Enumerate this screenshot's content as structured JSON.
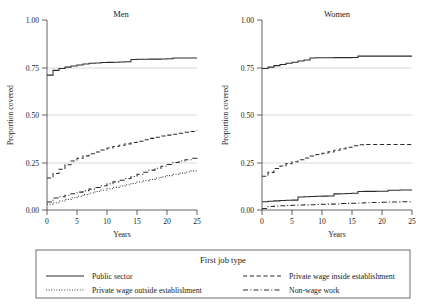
{
  "figure": {
    "background": "#ffffff",
    "line_color": "#2b2b2b",
    "grid_color": "#c8c8c8"
  },
  "panels": [
    {
      "title": "Men"
    },
    {
      "title": "Women"
    }
  ],
  "axes": {
    "xlabel": "Years",
    "ylabel": "Proportion covered",
    "xticks": [
      "0",
      "5",
      "10",
      "15",
      "20",
      "25"
    ],
    "yticks": [
      "0.00",
      "0.25",
      "0.50",
      "0.75",
      "1.00"
    ]
  },
  "legend": {
    "title": "First job type",
    "entries": [
      {
        "label": "Public sector",
        "style": "solid"
      },
      {
        "label": "Private wage inside establishment",
        "style": "dashed"
      },
      {
        "label": "Private wage outside establishment",
        "style": "dotted"
      },
      {
        "label": "Non-wage work",
        "style": "dashdot"
      }
    ]
  },
  "chart_data": {
    "type": "line",
    "title": "",
    "xlabel": "Years",
    "ylabel": "Proportion covered",
    "xlim": [
      0,
      25
    ],
    "ylim": [
      0.0,
      1.0
    ],
    "xticks": [
      0,
      5,
      10,
      15,
      20,
      25
    ],
    "yticks": [
      0.0,
      0.25,
      0.5,
      0.75,
      1.0
    ],
    "grid": "horizontal gridlines at 0.25, 0.50, 0.75",
    "legend_position": "bottom",
    "legend_title": "First job type",
    "panels": [
      {
        "name": "Men",
        "x": [
          0,
          1,
          2,
          3,
          4,
          5,
          6,
          7,
          8,
          9,
          10,
          11,
          12,
          13,
          14,
          15,
          16,
          17,
          18,
          19,
          20,
          21,
          22,
          23,
          24,
          25
        ],
        "series": [
          {
            "name": "Public sector",
            "style": "solid",
            "values": [
              0.71,
              0.735,
              0.745,
              0.752,
              0.758,
              0.763,
              0.768,
              0.772,
              0.774,
              0.776,
              0.777,
              0.778,
              0.779,
              0.78,
              0.792,
              0.793,
              0.793,
              0.794,
              0.794,
              0.795,
              0.796,
              0.8,
              0.8,
              0.8,
              0.8,
              0.8
            ]
          },
          {
            "name": "Private wage inside establishment",
            "style": "dashed",
            "values": [
              0.168,
              0.192,
              0.215,
              0.238,
              0.258,
              0.272,
              0.285,
              0.296,
              0.305,
              0.316,
              0.326,
              0.334,
              0.341,
              0.348,
              0.355,
              0.362,
              0.37,
              0.377,
              0.383,
              0.389,
              0.394,
              0.399,
              0.404,
              0.409,
              0.413,
              0.418
            ]
          },
          {
            "name": "Private wage outside establishment",
            "style": "dotted",
            "values": [
              0.03,
              0.038,
              0.047,
              0.056,
              0.064,
              0.072,
              0.081,
              0.089,
              0.097,
              0.104,
              0.112,
              0.119,
              0.126,
              0.133,
              0.14,
              0.147,
              0.154,
              0.161,
              0.168,
              0.175,
              0.181,
              0.188,
              0.194,
              0.2,
              0.206,
              0.212
            ]
          },
          {
            "name": "Non-wage work",
            "style": "dashdot",
            "values": [
              0.042,
              0.063,
              0.07,
              0.078,
              0.086,
              0.094,
              0.102,
              0.11,
              0.118,
              0.128,
              0.138,
              0.148,
              0.157,
              0.166,
              0.176,
              0.188,
              0.199,
              0.21,
              0.22,
              0.23,
              0.24,
              0.25,
              0.258,
              0.264,
              0.272,
              0.282
            ]
          }
        ]
      },
      {
        "name": "Women",
        "x": [
          0,
          1,
          2,
          3,
          4,
          5,
          6,
          7,
          8,
          9,
          10,
          11,
          12,
          13,
          14,
          15,
          16,
          17,
          18,
          19,
          20,
          21,
          22,
          23,
          24,
          25
        ],
        "series": [
          {
            "name": "Public sector",
            "style": "solid",
            "values": [
              0.745,
              0.752,
              0.76,
              0.766,
              0.772,
              0.778,
              0.784,
              0.79,
              0.8,
              0.801,
              0.801,
              0.801,
              0.802,
              0.802,
              0.802,
              0.803,
              0.81,
              0.81,
              0.81,
              0.81,
              0.81,
              0.81,
              0.81,
              0.81,
              0.81,
              0.81
            ]
          },
          {
            "name": "Private wage inside establishment",
            "style": "dashed",
            "values": [
              0.178,
              0.198,
              0.218,
              0.232,
              0.244,
              0.254,
              0.264,
              0.274,
              0.284,
              0.292,
              0.299,
              0.306,
              0.314,
              0.322,
              0.33,
              0.338,
              0.343,
              0.345,
              0.345,
              0.345,
              0.345,
              0.345,
              0.345,
              0.345,
              0.345,
              0.345
            ]
          },
          {
            "name": "Private wage outside establishment",
            "style": "dotted",
            "values": [
              0.0,
              0.0,
              0.0,
              0.0,
              0.0,
              0.0,
              0.0,
              0.0,
              0.0,
              0.0,
              0.0,
              0.0,
              0.0,
              0.0,
              0.0,
              0.0,
              0.0,
              0.0,
              0.0,
              0.0,
              0.0,
              0.0,
              0.0,
              0.0,
              0.0,
              0.0
            ]
          },
          {
            "name": "Non-wage work",
            "style": "dashdot",
            "values": [
              0.008,
              0.018,
              0.021,
              0.022,
              0.024,
              0.025,
              0.026,
              0.027,
              0.028,
              0.029,
              0.03,
              0.031,
              0.032,
              0.034,
              0.035,
              0.036,
              0.037,
              0.038,
              0.039,
              0.04,
              0.041,
              0.042,
              0.042,
              0.043,
              0.043,
              0.044
            ]
          },
          {
            "name": "Public sector solid low",
            "style": "solid",
            "values": [
              0.043,
              0.046,
              0.048,
              0.05,
              0.051,
              0.052,
              0.068,
              0.07,
              0.071,
              0.072,
              0.073,
              0.074,
              0.085,
              0.086,
              0.087,
              0.088,
              0.097,
              0.098,
              0.098,
              0.099,
              0.099,
              0.104,
              0.104,
              0.105,
              0.105,
              0.105
            ]
          }
        ]
      }
    ]
  }
}
